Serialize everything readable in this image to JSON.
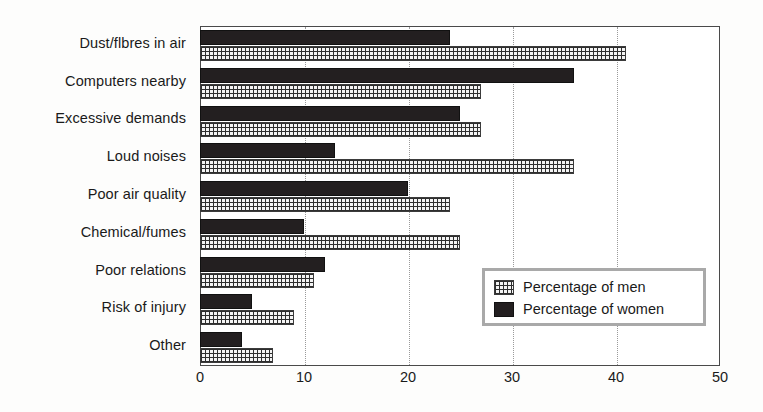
{
  "chart_data": {
    "type": "bar",
    "orientation": "horizontal",
    "title": "",
    "subtitle": "",
    "xlabel": "",
    "ylabel": "",
    "xlim": [
      0,
      50
    ],
    "xticks": [
      0,
      10,
      20,
      30,
      40,
      50
    ],
    "xtick_labels": [
      "0",
      "10",
      "20",
      "30",
      "40",
      "50"
    ],
    "grid": "vertical-dotted",
    "legend_position": "inside-bottom-right",
    "categories": [
      "Dust/flbres in air",
      "Computers nearby",
      "Excessive demands",
      "Loud noises",
      "Poor air quality",
      "Chemical/fumes",
      "Poor relations",
      "Risk of injury",
      "Other"
    ],
    "series": [
      {
        "name": "Percentage of men",
        "pattern": "crosshatch",
        "color": "#2e2e2e",
        "values": [
          41,
          27,
          27,
          36,
          24,
          25,
          11,
          9,
          7
        ]
      },
      {
        "name": "Percentage of women",
        "pattern": "solid",
        "color": "#231f20",
        "values": [
          24,
          36,
          25,
          13,
          20,
          10,
          12,
          5,
          4
        ]
      }
    ]
  },
  "legend": {
    "entries": [
      {
        "label": "Percentage of men"
      },
      {
        "label": "Percentage of women"
      }
    ]
  },
  "colors": {
    "axis": "#4a4a4a",
    "gridline": "#9a9a9a",
    "men_pattern": "#2e2e2e",
    "women_fill": "#231f20",
    "legend_border": "#a9a9a9",
    "background": "#ffffff",
    "text": "#1a1a1a"
  }
}
